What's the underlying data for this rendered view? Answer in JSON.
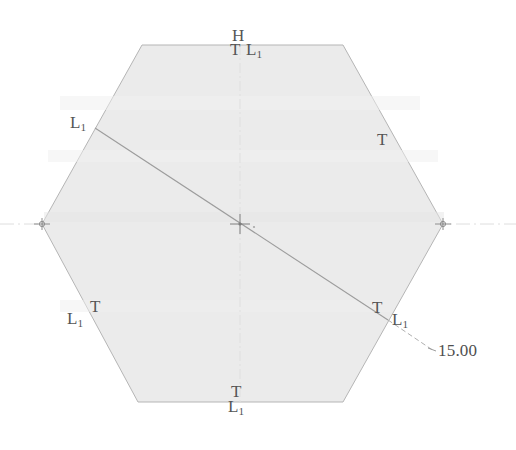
{
  "drawing": {
    "kind": "cad-sketch-hexagon",
    "background_color": "#ffffff",
    "fill_color": "#ebebeb",
    "edge_color": "#b9b9b9",
    "construction_color": "#9a9a9a",
    "centerline_color": "#dcdcdc",
    "text_color": "#555555"
  },
  "shape": {
    "name": "hexagon",
    "vertices": [
      {
        "x": 142,
        "y": 45
      },
      {
        "x": 343,
        "y": 45
      },
      {
        "x": 443,
        "y": 224
      },
      {
        "x": 343,
        "y": 402
      },
      {
        "x": 138,
        "y": 402
      },
      {
        "x": 42,
        "y": 224
      }
    ]
  },
  "center_mark": {
    "x": 240,
    "y": 224
  },
  "vertex_marks": [
    {
      "name": "left-vertex-mark",
      "x": 42,
      "y": 224
    },
    {
      "name": "right-vertex-mark",
      "x": 443,
      "y": 224
    }
  ],
  "centerlines": {
    "horizontal": {
      "x1": 0,
      "y1": 224,
      "x2": 516,
      "y2": 224
    },
    "vertical": {
      "x1": 240,
      "y1": 45,
      "x2": 240,
      "y2": 402
    }
  },
  "diagonal": {
    "name": "construction-diagonal",
    "start": {
      "x": 95,
      "y": 128
    },
    "end": {
      "x": 388,
      "y": 320
    }
  },
  "leader": {
    "name": "dimension-leader",
    "start": {
      "x": 388,
      "y": 320
    },
    "end": {
      "x": 434,
      "y": 351
    }
  },
  "dimension": {
    "value": "15.00",
    "x": 438,
    "y": 342
  },
  "constraints": [
    {
      "id": "top-h",
      "symbol": "H",
      "sub": "",
      "x": 232,
      "y": 27,
      "name": "constraint-horizontal-top"
    },
    {
      "id": "top-t",
      "symbol": "T",
      "sub": "",
      "x": 230,
      "y": 41,
      "name": "constraint-tangent-top"
    },
    {
      "id": "top-l1",
      "symbol": "L",
      "sub": "1",
      "x": 246,
      "y": 41,
      "name": "constraint-equal-top"
    },
    {
      "id": "upper-left-l1",
      "symbol": "L",
      "sub": "1",
      "x": 70,
      "y": 114,
      "name": "constraint-equal-upper-left"
    },
    {
      "id": "upper-right-t",
      "symbol": "T",
      "sub": "",
      "x": 377,
      "y": 131,
      "name": "constraint-tangent-upper-right"
    },
    {
      "id": "lower-left-t",
      "symbol": "T",
      "sub": "",
      "x": 90,
      "y": 298,
      "name": "constraint-tangent-lower-left"
    },
    {
      "id": "lower-left-l1",
      "symbol": "L",
      "sub": "1",
      "x": 67,
      "y": 310,
      "name": "constraint-equal-lower-left"
    },
    {
      "id": "lower-right-t",
      "symbol": "T",
      "sub": "",
      "x": 372,
      "y": 299,
      "name": "constraint-tangent-lower-right"
    },
    {
      "id": "lower-right-l1",
      "symbol": "L",
      "sub": "1",
      "x": 392,
      "y": 311,
      "name": "constraint-equal-lower-right"
    },
    {
      "id": "bottom-t",
      "symbol": "T",
      "sub": "",
      "x": 231,
      "y": 383,
      "name": "constraint-tangent-bottom"
    },
    {
      "id": "bottom-l1",
      "symbol": "L",
      "sub": "1",
      "x": 228,
      "y": 398,
      "name": "constraint-equal-bottom"
    }
  ]
}
